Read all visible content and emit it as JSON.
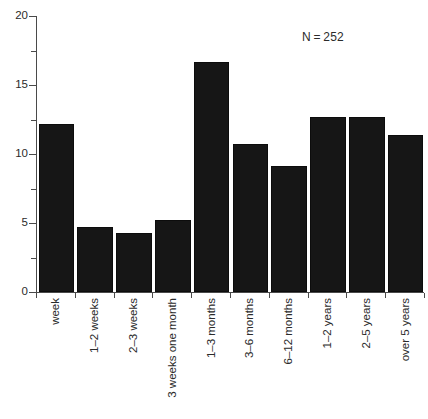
{
  "chart_data": {
    "type": "bar",
    "title": "",
    "subtitle": "",
    "xlabel": "",
    "ylabel": "",
    "categories": [
      "week",
      "1–2 weeks",
      "2–3 weeks",
      "3 weeks one month",
      "1–3 months",
      "3–6 months",
      "6–12 months",
      "1–2 years",
      "2–5 years",
      "over 5 years"
    ],
    "values": [
      12.2,
      4.7,
      4.3,
      5.2,
      16.7,
      10.7,
      9.1,
      12.7,
      12.7,
      11.4
    ],
    "ylim": [
      0,
      20
    ],
    "ytick_values": [
      0,
      5,
      10,
      15,
      20
    ],
    "ytick_labels": [
      "0",
      "5",
      "10",
      "15",
      "20"
    ],
    "yminor_tick_values": [
      2.5,
      7.5,
      12.5,
      17.5
    ],
    "grid": false,
    "legend": false,
    "legend_position": "none",
    "annotations": [
      {
        "text": "N = 252",
        "x_value": 7.6,
        "y_value": 19.0
      }
    ],
    "bar_color": "#161616",
    "axis_color": "#4a4a4a",
    "text_color": "#2b2b2b",
    "background_color": "#ffffff"
  }
}
